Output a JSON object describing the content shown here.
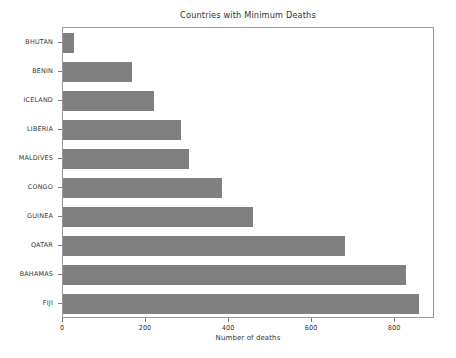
{
  "chart_data": {
    "type": "bar",
    "orientation": "horizontal",
    "title": "Countries with Minimum Deaths",
    "xlabel": "Number of deaths",
    "ylabel": "",
    "categories": [
      "BHUTAN",
      "BENIN",
      "ICELAND",
      "LIBERIA",
      "MALDIVES",
      "CONGO",
      "GUINEA",
      "QATAR",
      "BAHAMAS",
      "FIJI"
    ],
    "values": [
      26,
      165,
      218,
      285,
      303,
      383,
      458,
      680,
      825,
      858
    ],
    "xlim": [
      0,
      896
    ],
    "ylim": [
      0,
      10
    ],
    "xticks": [
      0,
      200,
      400,
      600,
      800
    ],
    "xtick_labels": [
      "0",
      "200",
      "400",
      "600",
      "800"
    ],
    "grid": false,
    "legend": null,
    "bar_color": "#808080",
    "axes_color": "#9a9a9a",
    "background_color": "#ffffff"
  },
  "figure": {
    "title": "Countries with Minimum Deaths",
    "xaxis_title": "Number of deaths"
  }
}
